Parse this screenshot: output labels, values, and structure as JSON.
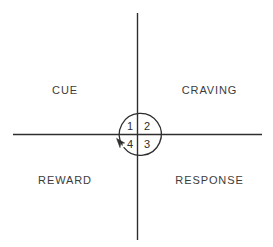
{
  "diagram": {
    "type": "quadrant-cycle",
    "background_color": "#ffffff",
    "line_color": "#2e2e2e",
    "text_color": "#3c3c3c",
    "axes": {
      "vertical_label": "vertical-axis",
      "horizontal_label": "horizontal-axis"
    },
    "quadrants": [
      {
        "id": "cue",
        "label": "CUE",
        "position": "top-left"
      },
      {
        "id": "craving",
        "label": "CRAVING",
        "position": "top-right"
      },
      {
        "id": "reward",
        "label": "REWARD",
        "position": "bottom-left"
      },
      {
        "id": "response",
        "label": "RESPONSE",
        "position": "bottom-right"
      }
    ],
    "cycle": {
      "direction": "counterclockwise",
      "arrow_name": "cycle-arrow",
      "steps": [
        {
          "number": "1",
          "quadrant": "cue"
        },
        {
          "number": "2",
          "quadrant": "craving"
        },
        {
          "number": "3",
          "quadrant": "response"
        },
        {
          "number": "4",
          "quadrant": "reward"
        }
      ]
    }
  }
}
